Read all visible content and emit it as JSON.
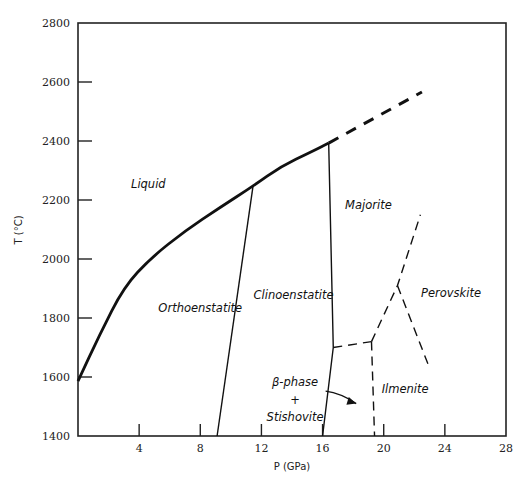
{
  "chart_data": {
    "type": "line",
    "title": "",
    "xlabel": "P (GPa)",
    "ylabel": "T (°C)",
    "xlim": [
      0,
      28
    ],
    "ylim": [
      1400,
      2800
    ],
    "xticks": [
      4,
      8,
      12,
      16,
      20,
      24,
      28
    ],
    "yticks": [
      1400,
      1600,
      1800,
      2000,
      2200,
      2400,
      2600,
      2800
    ],
    "grid": false,
    "legend": "none",
    "series": [
      {
        "name": "solidus",
        "style": "solid-thick",
        "points": [
          [
            0,
            1586
          ],
          [
            1.4,
            1742
          ],
          [
            3.0,
            1905
          ],
          [
            4.8,
            2005
          ],
          [
            7.0,
            2095
          ],
          [
            9.3,
            2175
          ],
          [
            11.45,
            2247
          ],
          [
            13.3,
            2315
          ],
          [
            15.2,
            2362
          ],
          [
            16.4,
            2393
          ]
        ]
      },
      {
        "name": "solidus-extrapolated",
        "style": "dashed-thick",
        "points": [
          [
            16.4,
            2393
          ],
          [
            22.5,
            2566
          ]
        ]
      },
      {
        "name": "ortho-clino-boundary",
        "style": "solid-thin",
        "points": [
          [
            11.45,
            2247
          ],
          [
            9.1,
            1400
          ]
        ]
      },
      {
        "name": "clino-majorite-boundary",
        "style": "solid-thin",
        "points": [
          [
            16.4,
            2393
          ],
          [
            16.7,
            1700
          ],
          [
            16.0,
            1400
          ]
        ]
      },
      {
        "name": "beta-majorite-boundary",
        "style": "dashed-thin",
        "points": [
          [
            16.7,
            1700
          ],
          [
            19.2,
            1720
          ]
        ]
      },
      {
        "name": "stishovite-ilmenite-boundary",
        "style": "dashed-thin",
        "points": [
          [
            19.2,
            1720
          ],
          [
            19.4,
            1400
          ]
        ]
      },
      {
        "name": "majorite-perovskite-boundary",
        "style": "dashed-thin",
        "points": [
          [
            19.2,
            1720
          ],
          [
            20.9,
            1910
          ],
          [
            22.4,
            2150
          ]
        ]
      },
      {
        "name": "ilmenite-perovskite-boundary",
        "style": "dashed-thin",
        "points": [
          [
            20.9,
            1910
          ],
          [
            23.0,
            1630
          ]
        ]
      }
    ],
    "annotations": [
      {
        "text": "Liquid",
        "at": [
          4.6,
          2240
        ]
      },
      {
        "text": "Orthoenstatite",
        "at": [
          8.0,
          1820
        ]
      },
      {
        "text": "Clinoenstatite",
        "at": [
          14.1,
          1865
        ]
      },
      {
        "text": "Majorite",
        "at": [
          19.0,
          2170
        ]
      },
      {
        "text": "Perovskite",
        "at": [
          24.4,
          1870
        ]
      },
      {
        "text": "Ilmenite",
        "at": [
          21.4,
          1545
        ]
      },
      {
        "text": "β-phase",
        "at": [
          14.2,
          1570
        ]
      },
      {
        "text": "+",
        "at": [
          14.2,
          1510
        ]
      },
      {
        "text": "Stishovite",
        "at": [
          14.2,
          1450
        ]
      }
    ],
    "arrow": {
      "from": [
        16.2,
        1552
      ],
      "to": [
        18.2,
        1510
      ]
    }
  }
}
